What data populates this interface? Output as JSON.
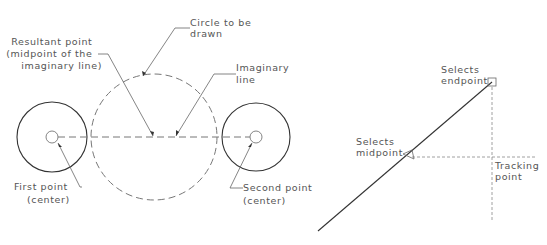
{
  "left_figure": {
    "title": "Midpoint between two points",
    "labels": {
      "circle_to_be_drawn": [
        "Circle to be",
        "drawn"
      ],
      "resultant_point": [
        "Resultant point",
        "(midpoint of the",
        "imaginary line)"
      ],
      "imaginary_line": [
        "Imaginary",
        "line"
      ],
      "first_point": [
        "First point",
        "(center)"
      ],
      "second_point": [
        "Second point",
        "(center)"
      ]
    },
    "shapes": {
      "left_circle": {
        "cx": 52,
        "cy": 137,
        "r": 35,
        "inner_r": 6
      },
      "right_circle": {
        "cx": 256,
        "cy": 137,
        "r": 34,
        "inner_r": 6
      },
      "dashed_circle": {
        "cx": 154,
        "cy": 137,
        "r": 63
      },
      "imaginary_line": {
        "x1": 58,
        "y1": 137,
        "x2": 250,
        "y2": 137
      }
    }
  },
  "right_figure": {
    "title": "Object snap tracking",
    "labels": {
      "selects_endpoint": [
        "Selects",
        "endpoint"
      ],
      "selects_midpoint": [
        "Selects",
        "midpoint"
      ],
      "tracking_point": [
        "Tracking",
        "point"
      ]
    },
    "shapes": {
      "line": {
        "x1": 318,
        "y1": 231,
        "x2": 492,
        "y2": 82
      },
      "endpoint_marker": {
        "x": 492,
        "y": 82,
        "size": 8
      },
      "midpoint_marker": {
        "x": 405,
        "y": 156
      },
      "tracking_h": {
        "x1": 410,
        "y1": 157,
        "x2": 535,
        "y2": 157
      },
      "tracking_v": {
        "x1": 492,
        "y1": 86,
        "x2": 492,
        "y2": 222
      }
    }
  }
}
